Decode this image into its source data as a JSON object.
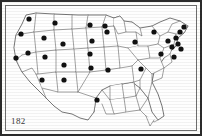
{
  "figure": {
    "label": "182",
    "border_color": "#2b2b2b",
    "background_color": "#fefefe",
    "marker_color": "#111111",
    "outline_color": "#555555"
  },
  "map_data": {
    "type": "dot-distribution-map",
    "region": "Contiguous United States",
    "marker_shape": "filled-circle",
    "marker_radius": 2.6,
    "marker_count": 31,
    "description": "Black dots distributed across western, mountain, plains and northeastern states; southeastern states have no markers",
    "markers": [
      {
        "x": 27,
        "y": 17
      },
      {
        "x": 19,
        "y": 32
      },
      {
        "x": 14,
        "y": 56
      },
      {
        "x": 26,
        "y": 51
      },
      {
        "x": 40,
        "y": 78
      },
      {
        "x": 42,
        "y": 36
      },
      {
        "x": 43,
        "y": 55
      },
      {
        "x": 62,
        "y": 78
      },
      {
        "x": 53,
        "y": 21
      },
      {
        "x": 61,
        "y": 42
      },
      {
        "x": 62,
        "y": 63
      },
      {
        "x": 88,
        "y": 23
      },
      {
        "x": 90,
        "y": 39
      },
      {
        "x": 88,
        "y": 52
      },
      {
        "x": 89,
        "y": 66
      },
      {
        "x": 95,
        "y": 98
      },
      {
        "x": 103,
        "y": 24
      },
      {
        "x": 105,
        "y": 30
      },
      {
        "x": 106,
        "y": 68
      },
      {
        "x": 133,
        "y": 40
      },
      {
        "x": 139,
        "y": 67
      },
      {
        "x": 152,
        "y": 30
      },
      {
        "x": 159,
        "y": 52
      },
      {
        "x": 166,
        "y": 39
      },
      {
        "x": 170,
        "y": 45
      },
      {
        "x": 174,
        "y": 36
      },
      {
        "x": 176,
        "y": 42
      },
      {
        "x": 178,
        "y": 30
      },
      {
        "x": 172,
        "y": 55
      },
      {
        "x": 182,
        "y": 25
      },
      {
        "x": 179,
        "y": 47
      }
    ]
  }
}
